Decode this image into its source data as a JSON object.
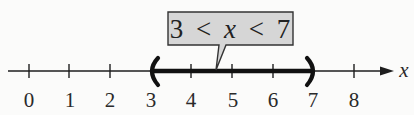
{
  "diagram": {
    "type": "number-line",
    "axis_label": "x",
    "ticks": [
      "0",
      "1",
      "2",
      "3",
      "4",
      "5",
      "6",
      "7",
      "8"
    ],
    "interval": {
      "left": "3",
      "right": "7",
      "left_endpoint": "open",
      "right_endpoint": "open"
    },
    "callout": {
      "text_parts": [
        "3",
        "<",
        "x",
        "<",
        "7"
      ],
      "text": "3 < x < 7"
    },
    "colors": {
      "background": "#fbfbfa",
      "line": "#1e1e1e",
      "callout_fill": "#d6d6d6",
      "callout_border": "#333333"
    }
  }
}
